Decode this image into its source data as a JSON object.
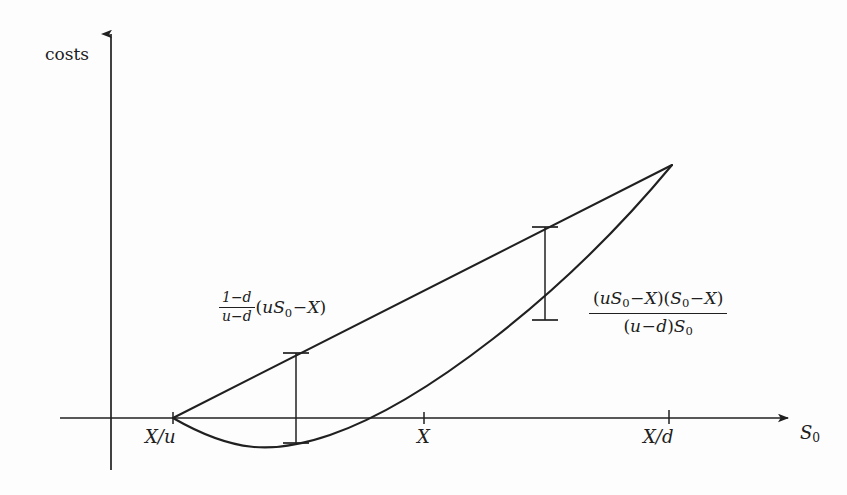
{
  "figure": {
    "kind": "annotated-math-diagram",
    "background_color": "#fdfdfd",
    "stroke_color": "#202020",
    "width": 847,
    "height": 495
  },
  "axes": {
    "y_axis_label": "costs",
    "x_axis_label_main": "S",
    "x_axis_label_sub": "0",
    "x_axis": {
      "y": 418,
      "x_start": 60,
      "x_end": 790
    },
    "y_axis": {
      "x": 111,
      "y_top": 32,
      "y_bottom": 470
    }
  },
  "ticks": [
    {
      "name": "tick-x-over-u",
      "label_main": "X/u",
      "x": 173,
      "label_x": 145,
      "label_y": 428
    },
    {
      "name": "tick-x",
      "label_main": "X",
      "x": 424,
      "label_x": 417,
      "label_y": 428
    },
    {
      "name": "tick-x-over-d",
      "label_main": "X/d",
      "x": 669,
      "label_x": 643,
      "label_y": 428
    }
  ],
  "curves": {
    "straight_line": {
      "name": "chord-line",
      "from": {
        "x": 173,
        "y": 418
      },
      "to": {
        "x": 672,
        "y": 165
      }
    },
    "parabola": {
      "name": "payoff-curve",
      "from": {
        "x": 173,
        "y": 418
      },
      "control": {
        "x": 424,
        "y": 470
      },
      "to": {
        "x": 672,
        "y": 165
      },
      "crosses_axis_at_x": 424,
      "minimum": {
        "x": 302,
        "y": 443
      }
    }
  },
  "measure_bars": [
    {
      "name": "measure-bar-left",
      "x": 296,
      "y_top": 353,
      "y_bottom": 443,
      "cap_half_width": 13
    },
    {
      "name": "measure-bar-right",
      "x": 545,
      "y_top": 227,
      "y_bottom": 320,
      "cap_half_width": 13
    }
  ],
  "formulas": {
    "left": {
      "name": "formula-left",
      "plain_text": "((1-d)/(u-d))(uS0-X)",
      "numerator": "1−d",
      "denominator": "u−d",
      "tail_open": "(",
      "tail_u": "u",
      "tail_S": "S",
      "tail_S_sub": "0",
      "tail_minus": "−",
      "tail_X": "X",
      "tail_close": ")",
      "x": 218,
      "y": 292
    },
    "right": {
      "name": "formula-right",
      "plain_text": "(uS0-X)(S0-X) / ((u-d)S0)",
      "numerator_open1": "(",
      "numerator_u": "u",
      "numerator_S1": "S",
      "numerator_S1_sub": "0",
      "numerator_minus1": "−",
      "numerator_X1": "X",
      "numerator_close1": ")",
      "numerator_open2": "(",
      "numerator_S2": "S",
      "numerator_S2_sub": "0",
      "numerator_minus2": "−",
      "numerator_X2": "X",
      "numerator_close2": ")",
      "denominator_open": "(",
      "denominator_u": "u",
      "denominator_minus": "−",
      "denominator_d": "d",
      "denominator_close": ")",
      "denominator_S": "S",
      "denominator_S_sub": "0",
      "x": 589,
      "y": 288
    }
  }
}
